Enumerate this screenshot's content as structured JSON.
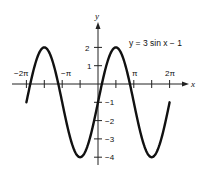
{
  "chart_data": {
    "type": "line",
    "title": "",
    "annotation": "y = 3 sin x − 1",
    "xlabel": "x",
    "ylabel": "y",
    "function": "y = 3*sin(x) - 1",
    "xlim": [
      -6.2832,
      6.2832
    ],
    "ylim": [
      -4,
      2
    ],
    "x_tick_labels": [
      "−2π",
      "−π",
      "π",
      "2π"
    ],
    "x_tick_values": [
      -6.2832,
      -3.1416,
      3.1416,
      6.2832
    ],
    "x_minor_ticks": [
      -6.2832,
      -4.7124,
      -3.1416,
      -1.5708,
      0,
      1.5708,
      3.1416,
      4.7124,
      6.2832
    ],
    "y_tick_labels": [
      "2",
      "1",
      "−1",
      "−2",
      "−3",
      "−4"
    ],
    "y_tick_values": [
      2,
      1,
      -1,
      -2,
      -3,
      -4
    ],
    "series": [
      {
        "name": "y = 3 sin x − 1",
        "x": [
          -6.2832,
          -4.7124,
          -3.1416,
          -1.5708,
          0,
          1.5708,
          3.1416,
          4.7124,
          6.2832
        ],
        "y": [
          -1,
          2,
          -1,
          -4,
          -1,
          2,
          -1,
          -4,
          -1
        ]
      }
    ],
    "grid": false,
    "legend": "none"
  },
  "labels": {
    "equation": "y = 3 sin x − 1",
    "x_axis": "x",
    "y_axis": "y",
    "neg_2pi": "−2π",
    "neg_pi": "−π",
    "pi": "π",
    "two_pi": "2π",
    "y2": "2",
    "y1": "1",
    "ym1": "−1",
    "ym2": "−2",
    "ym3": "−3",
    "ym4": "−4"
  }
}
